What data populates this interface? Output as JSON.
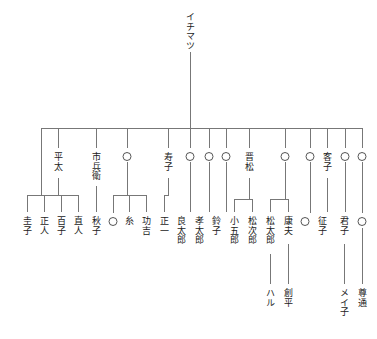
{
  "diagram": {
    "type": "family-tree",
    "orientation": "top-down, vertical Japanese text",
    "generations": 4,
    "line_color": "#777777",
    "text_color": "#1a1a1a",
    "background": "#ffffff"
  },
  "root": {
    "label": "イチマツ",
    "x": 190,
    "y": 12
  },
  "generation2": [
    {
      "label": "平太",
      "x": 58,
      "y": 152,
      "circle": false
    },
    {
      "label": "市兵衛",
      "x": 96,
      "y": 152,
      "circle": false
    },
    {
      "label": "",
      "x": 127,
      "y": 152,
      "circle": true
    },
    {
      "label": "寿子",
      "x": 168,
      "y": 152,
      "circle": false
    },
    {
      "label": "",
      "x": 190,
      "y": 152,
      "circle": true
    },
    {
      "label": "",
      "x": 209,
      "y": 152,
      "circle": true
    },
    {
      "label": "",
      "x": 226,
      "y": 152,
      "circle": true
    },
    {
      "label": "晋松",
      "x": 249,
      "y": 152,
      "circle": false
    },
    {
      "label": "",
      "x": 285,
      "y": 152,
      "circle": true
    },
    {
      "label": "",
      "x": 310,
      "y": 152,
      "circle": true
    },
    {
      "label": "客子",
      "x": 327,
      "y": 152,
      "circle": false
    },
    {
      "label": "",
      "x": 345,
      "y": 152,
      "circle": true
    },
    {
      "label": "",
      "x": 362,
      "y": 152,
      "circle": true
    }
  ],
  "generation3": [
    {
      "label": "圭子",
      "x": 27,
      "y": 216,
      "circle": false
    },
    {
      "label": "正人",
      "x": 44,
      "y": 216,
      "circle": false
    },
    {
      "label": "百子",
      "x": 61,
      "y": 216,
      "circle": false
    },
    {
      "label": "直人",
      "x": 78,
      "y": 216,
      "circle": false
    },
    {
      "label": "秋子",
      "x": 96,
      "y": 216,
      "circle": false
    },
    {
      "label": "",
      "x": 113,
      "y": 218,
      "circle": true
    },
    {
      "label": "糸",
      "x": 129,
      "y": 216,
      "circle": false
    },
    {
      "label": "功吉",
      "x": 146,
      "y": 216,
      "circle": false
    },
    {
      "label": "正一",
      "x": 164,
      "y": 216,
      "circle": false
    },
    {
      "label": "良太郎",
      "x": 181,
      "y": 216,
      "circle": false
    },
    {
      "label": "孝太郎",
      "x": 199,
      "y": 216,
      "circle": false
    },
    {
      "label": "鈴子",
      "x": 216,
      "y": 216,
      "circle": false
    },
    {
      "label": "小五郎",
      "x": 234,
      "y": 216,
      "circle": false
    },
    {
      "label": "松次郎",
      "x": 252,
      "y": 216,
      "circle": false
    },
    {
      "label": "松太郎",
      "x": 270,
      "y": 216,
      "circle": false
    },
    {
      "label": "康夫",
      "x": 288,
      "y": 216,
      "circle": false
    },
    {
      "label": "",
      "x": 305,
      "y": 218,
      "circle": true
    },
    {
      "label": "征子",
      "x": 322,
      "y": 216,
      "circle": false
    },
    {
      "label": "君子",
      "x": 344,
      "y": 216,
      "circle": false
    },
    {
      "label": "",
      "x": 362,
      "y": 218,
      "circle": true
    }
  ],
  "generation4": [
    {
      "label": "ハル",
      "x": 270,
      "y": 288,
      "circle": false
    },
    {
      "label": "創平",
      "x": 288,
      "y": 288,
      "circle": false
    },
    {
      "label": "メイ子",
      "x": 344,
      "y": 288,
      "circle": false
    },
    {
      "label": "尊通",
      "x": 362,
      "y": 288,
      "circle": false
    }
  ],
  "structure": {
    "root_stem": {
      "x": 190,
      "y1": 52,
      "y2": 128
    },
    "main_bus": {
      "y": 128,
      "x1": 41,
      "x2": 362
    },
    "bus_drops_y2": 148,
    "bus_drop_xs": [
      41,
      58,
      96,
      127,
      168,
      190,
      209,
      226,
      249,
      285,
      310,
      327,
      345,
      362
    ],
    "sub_families": [
      {
        "parent": "平太",
        "stem_x": 58,
        "stem_y1": 178,
        "bar_y": 195,
        "children_x": [
          27,
          44,
          61,
          78
        ],
        "drop_y2": 212
      },
      {
        "parent": "市兵衛",
        "stem_x": 96,
        "stem_y1": 186,
        "bar_y": 195,
        "children_x": [
          96
        ],
        "drop_y2": 212
      },
      {
        "parent": "○",
        "stem_x": 127,
        "stem_y1": 162,
        "bar_y": 195,
        "children_x": [
          113,
          129,
          146
        ],
        "drop_y2": 212
      },
      {
        "parent": "寿子",
        "stem_x": 168,
        "stem_y1": 178,
        "bar_y": 195,
        "children_x": [
          164
        ],
        "drop_y2": 212
      },
      {
        "parent": "晋松",
        "stem_x": 249,
        "stem_y1": 178,
        "bar_y": 199,
        "children_x": [
          234,
          252
        ],
        "drop_y2": 212
      },
      {
        "parent": "○",
        "stem_x": 285,
        "stem_y1": 162,
        "bar_y": 199,
        "children_x": [
          270,
          288
        ],
        "drop_y2": 212
      }
    ],
    "gen2_straight_drops": [
      {
        "x": 190,
        "y1": 162,
        "y2": 212
      },
      {
        "x": 209,
        "y1": 162,
        "y2": 212
      },
      {
        "x": 226,
        "y1": 162,
        "y2": 212
      },
      {
        "x": 310,
        "y1": 162,
        "y2": 212
      },
      {
        "x": 327,
        "y1": 178,
        "y2": 212
      },
      {
        "x": 345,
        "y1": 162,
        "y2": 212
      },
      {
        "x": 362,
        "y1": 162,
        "y2": 212
      }
    ],
    "gen3_to_gen4_drops": [
      {
        "x": 270,
        "y1": 252,
        "y2": 284
      },
      {
        "x": 288,
        "y1": 242,
        "y2": 284
      },
      {
        "x": 344,
        "y1": 242,
        "y2": 284
      },
      {
        "x": 362,
        "y1": 228,
        "y2": 284
      }
    ]
  }
}
